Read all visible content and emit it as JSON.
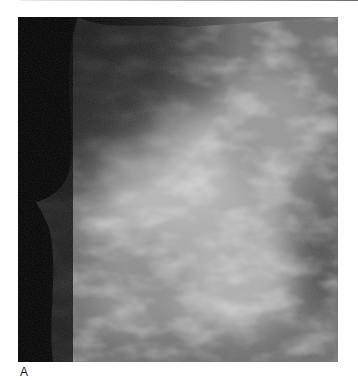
{
  "figure": {
    "image_description": "Mammogram (breast X-ray) grayscale image showing dense fibroglandular tissue",
    "panel_label": "A"
  },
  "colors": {
    "background": "#ffffff",
    "dark_background": "#000000",
    "tissue_light": "#d8d8d8",
    "tissue_mid": "#8c8c8c",
    "label_text": "#1a1a1a"
  }
}
